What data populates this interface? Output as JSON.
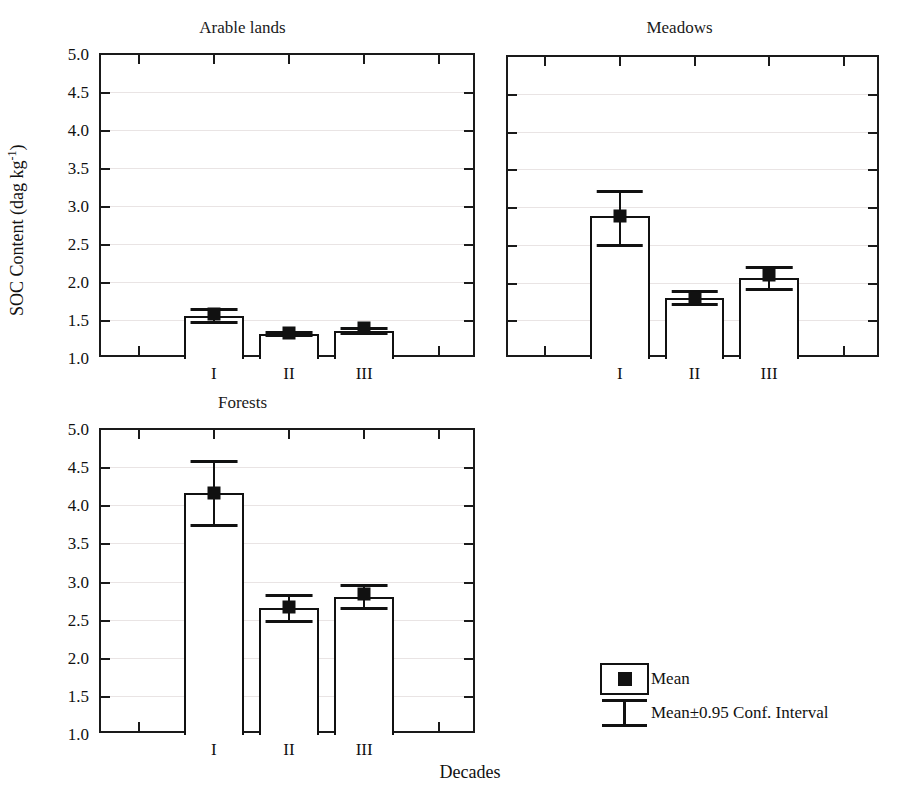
{
  "figure": {
    "ylabel": "SOC Content (dag kg",
    "ylabel_sup": "-1",
    "ylabel_tail": ")",
    "xlabel": "Decades"
  },
  "legend": {
    "mean_label": "Mean",
    "ci_label": "Mean±0.95 Conf. Interval"
  },
  "chart_data": [
    {
      "type": "bar",
      "title": "Arable lands",
      "categories": [
        "I",
        "II",
        "III"
      ],
      "values": [
        1.57,
        1.33,
        1.37
      ],
      "ci_lower": [
        1.49,
        1.31,
        1.34
      ],
      "ci_upper": [
        1.66,
        1.36,
        1.41
      ],
      "means": [
        1.59,
        1.34,
        1.41
      ],
      "xlabel": "Decades",
      "ylabel": "SOC Content (dag kg-1)",
      "ylim": [
        1.0,
        5.0
      ],
      "yticks": [
        "1.0",
        "1.5",
        "2.0",
        "2.5",
        "3.0",
        "3.5",
        "4.0",
        "4.5",
        "5.0"
      ],
      "grid": true,
      "legend": "none"
    },
    {
      "type": "bar",
      "title": "Meadows",
      "categories": [
        "I",
        "II",
        "III"
      ],
      "values": [
        2.89,
        1.81,
        2.07
      ],
      "ci_lower": [
        2.51,
        1.73,
        1.93
      ],
      "ci_upper": [
        3.23,
        1.9,
        2.22
      ],
      "means": [
        2.9,
        1.81,
        2.11
      ],
      "xlabel": "Decades",
      "ylabel": "SOC Content (dag kg-1)",
      "ylim": [
        1.0,
        5.0
      ],
      "yticks": [
        "1.0",
        "1.5",
        "2.0",
        "2.5",
        "3.0",
        "3.5",
        "4.0",
        "4.5",
        "5.0"
      ],
      "grid": true,
      "legend": "none"
    },
    {
      "type": "bar",
      "title": "Forests",
      "categories": [
        "I",
        "II",
        "III"
      ],
      "values": [
        4.17,
        2.66,
        2.81
      ],
      "ci_lower": [
        3.76,
        2.49,
        2.67
      ],
      "ci_upper": [
        4.59,
        2.83,
        2.97
      ],
      "means": [
        4.18,
        2.68,
        2.85
      ],
      "xlabel": "Decades",
      "ylabel": "SOC Content (dag kg-1)",
      "ylim": [
        1.0,
        5.0
      ],
      "yticks": [
        "1.0",
        "1.5",
        "2.0",
        "2.5",
        "3.0",
        "3.5",
        "4.0",
        "4.5",
        "5.0"
      ],
      "grid": true,
      "legend": "none"
    }
  ]
}
